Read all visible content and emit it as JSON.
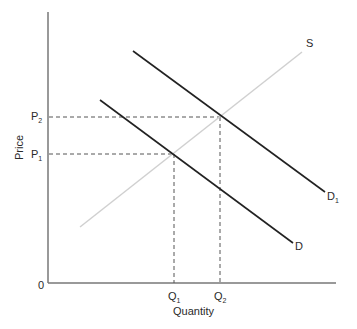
{
  "diagram": {
    "type": "supply-demand",
    "axes": {
      "x_label": "Quantity",
      "y_label": "Price",
      "origin_label": "0",
      "color": "#777777"
    },
    "curves": [
      {
        "name": "S",
        "label": "S",
        "sub": "",
        "color": "#d0d0d0",
        "x1": 80,
        "y1": 227,
        "x2": 302,
        "y2": 52
      },
      {
        "name": "D",
        "label": "D",
        "sub": "",
        "color": "#222222",
        "x1": 100,
        "y1": 100,
        "x2": 293,
        "y2": 243
      },
      {
        "name": "D1",
        "label": "D",
        "sub": "1",
        "color": "#222222",
        "x1": 133,
        "y1": 51,
        "x2": 325,
        "y2": 192
      }
    ],
    "equilibria": [
      {
        "price_label": "P",
        "price_sub": "1",
        "qty_label": "Q",
        "qty_sub": "1",
        "x": 174,
        "y": 154
      },
      {
        "price_label": "P",
        "price_sub": "2",
        "qty_label": "Q",
        "qty_sub": "2",
        "x": 220,
        "y": 117
      }
    ],
    "guide_color": "#555555"
  }
}
